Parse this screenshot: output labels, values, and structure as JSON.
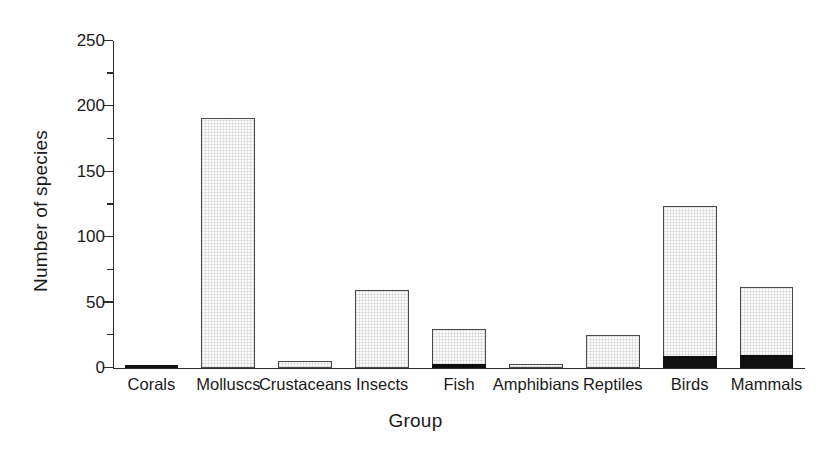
{
  "chart_data": {
    "type": "bar",
    "title": "",
    "xlabel": "Group",
    "ylabel": "Number of species",
    "ylim": [
      0,
      250
    ],
    "y_major_ticks": [
      0,
      50,
      100,
      150,
      200,
      250
    ],
    "y_minor_ticks": [
      25,
      75,
      125,
      175,
      225
    ],
    "grid": false,
    "legend": null,
    "stacked": true,
    "categories": [
      "Corals",
      "Molluscs",
      "Crustaceans",
      "Insects",
      "Fish",
      "Amphibians",
      "Reptiles",
      "Birds",
      "Mammals"
    ],
    "series": [
      {
        "name": "black-segment",
        "color": "#100f0f",
        "values": [
          1,
          0,
          0,
          0,
          3,
          0,
          0,
          9,
          10
        ]
      },
      {
        "name": "stippled-segment",
        "color": "#fbfbfb",
        "values": [
          0,
          191,
          5,
          60,
          27,
          3,
          25,
          115,
          52
        ]
      }
    ],
    "totals": [
      1,
      191,
      5,
      60,
      30,
      3,
      25,
      124,
      62
    ]
  },
  "axes": {
    "y": {
      "title": "Number of species",
      "labels": [
        "0",
        "50",
        "100",
        "150",
        "200",
        "250"
      ]
    },
    "x": {
      "title": "Group",
      "labels": [
        "Corals",
        "Molluscs",
        "Crustaceans",
        "Insects",
        "Fish",
        "Amphibians",
        "Reptiles",
        "Birds",
        "Mammals"
      ]
    }
  },
  "colors": {
    "axis": "#2b2b2b",
    "bar_outline": "#4a4a4a",
    "bar_fill": "#fbfbfb",
    "bar_black": "#100f0f",
    "background": "#ffffff",
    "text": "#1a1a1a"
  }
}
